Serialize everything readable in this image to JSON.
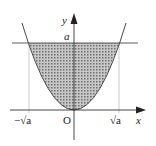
{
  "diagram": {
    "labels": {
      "y_axis": "y",
      "x_axis": "x",
      "origin": "O",
      "level": "a",
      "neg_root": "−√a",
      "pos_root": "√a"
    },
    "colors": {
      "stroke": "#333333",
      "fill": "#9a9a9a",
      "guide": "#999999"
    }
  }
}
